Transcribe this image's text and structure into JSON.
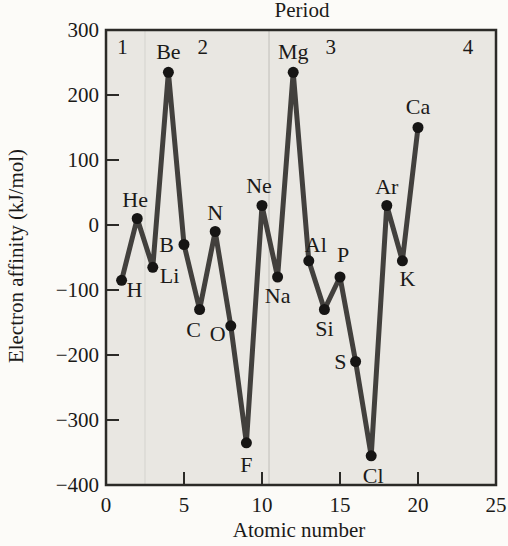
{
  "figure": {
    "top_axis_title": "Period",
    "x_axis_title": "Atomic number",
    "y_axis_title": "Electron affinity (kJ/mol)"
  },
  "colors": {
    "line": "#42403d",
    "point": "#161514",
    "plot_background": "#e9e7e2",
    "frame": "#2b2a27",
    "text": "#1b1a18",
    "period_divider": "#c6c5c0",
    "period_divider_faint": "#d8d7d2",
    "page_background": "#fcfbf8"
  },
  "chart_data": {
    "type": "line",
    "title": "Period",
    "xlabel": "Atomic number",
    "ylabel": "Electron affinity (kJ/mol)",
    "xlim": [
      0,
      25
    ],
    "ylim": [
      -400,
      300
    ],
    "x_ticks": [
      0,
      5,
      10,
      15,
      20,
      25
    ],
    "y_ticks": [
      300,
      200,
      100,
      0,
      -100,
      -200,
      -300,
      -400
    ],
    "grid": false,
    "legend": "none",
    "series_name": "Electron affinity (kJ/mol)",
    "points": [
      {
        "element": "H",
        "atomic_number": 1,
        "value": -85
      },
      {
        "element": "He",
        "atomic_number": 2,
        "value": 10
      },
      {
        "element": "Li",
        "atomic_number": 3,
        "value": -65
      },
      {
        "element": "Be",
        "atomic_number": 4,
        "value": 235
      },
      {
        "element": "B",
        "atomic_number": 5,
        "value": -30
      },
      {
        "element": "C",
        "atomic_number": 6,
        "value": -130
      },
      {
        "element": "N",
        "atomic_number": 7,
        "value": -10
      },
      {
        "element": "O",
        "atomic_number": 8,
        "value": -155
      },
      {
        "element": "F",
        "atomic_number": 9,
        "value": -335
      },
      {
        "element": "Ne",
        "atomic_number": 10,
        "value": 30
      },
      {
        "element": "Na",
        "atomic_number": 11,
        "value": -80
      },
      {
        "element": "Mg",
        "atomic_number": 12,
        "value": 235
      },
      {
        "element": "Al",
        "atomic_number": 13,
        "value": -55
      },
      {
        "element": "Si",
        "atomic_number": 14,
        "value": -130
      },
      {
        "element": "P",
        "atomic_number": 15,
        "value": -80
      },
      {
        "element": "S",
        "atomic_number": 16,
        "value": -210
      },
      {
        "element": "Cl",
        "atomic_number": 17,
        "value": -355
      },
      {
        "element": "Ar",
        "atomic_number": 18,
        "value": 30
      },
      {
        "element": "K",
        "atomic_number": 19,
        "value": -55
      },
      {
        "element": "Ca",
        "atomic_number": 20,
        "value": 150
      }
    ],
    "period_labels": [
      {
        "label": "1",
        "z": 1.05
      },
      {
        "label": "2",
        "z": 6.2
      },
      {
        "label": "3",
        "z": 14.4
      },
      {
        "label": "4",
        "z": 23.2
      }
    ],
    "period_dividers_z": [
      2.5,
      10.45
    ]
  }
}
